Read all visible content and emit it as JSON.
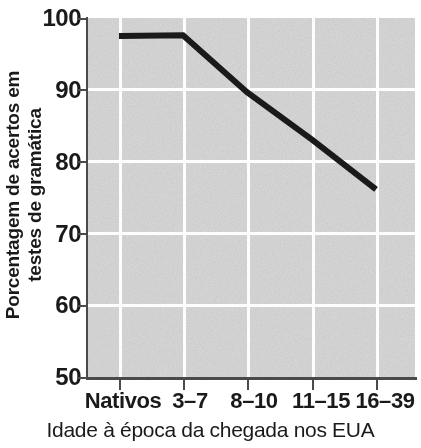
{
  "chart_data": {
    "type": "line",
    "title": "",
    "subtitle": "",
    "categories": [
      "Nativos",
      "3–7",
      "8–10",
      "11–15",
      "16–39"
    ],
    "values": [
      97.5,
      97.6,
      89.7,
      83.1,
      76.2
    ],
    "series": [
      {
        "name": "Porcentagem de acertos",
        "values": [
          97.5,
          97.6,
          89.7,
          83.1,
          76.2
        ]
      }
    ],
    "xlabel": "Idade à época da chegada nos EUA",
    "ylabel": "Porcentagem de acertos em testes de gramática",
    "ylabel_line1": "Porcentagem de acertos em",
    "ylabel_line2": "testes de gramática",
    "ylim": [
      50,
      100
    ],
    "yticks": [
      100,
      90,
      80,
      70,
      60,
      50
    ],
    "ytick_labels": [
      "100",
      "90",
      "80",
      "70",
      "60",
      "50"
    ],
    "xtick_labels": [
      "Nativos",
      "3–7",
      "8–10",
      "11–15",
      "16–39"
    ],
    "grid": true,
    "grid_color": "#fdfdfd",
    "legend": false,
    "legend_position": "none",
    "line_color": "#1a1a1a",
    "plot_background": "#d6d6d6",
    "axis_color": "#4a4a4a"
  }
}
